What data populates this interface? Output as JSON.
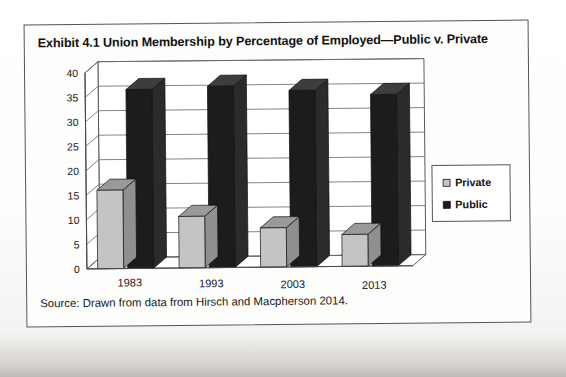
{
  "exhibit": {
    "title": "Exhibit 4.1  Union Membership by Percentage of Employed—Public v. Private",
    "source": "Source: Drawn from data from Hirsch and Macpherson 2014."
  },
  "colors": {
    "private_fill": "#c4c4c4",
    "private_top": "#9a9a9a",
    "private_side": "#8f8f8f",
    "public_fill": "#1c1c1c",
    "public_top": "#3d3d3d",
    "public_side": "#2b2b2b",
    "grid": "#6f6f6f",
    "frame": "#4a4a4a",
    "text": "#1a1a1a"
  },
  "chart_data": {
    "type": "bar",
    "title": "Exhibit 4.1  Union Membership by Percentage of Employed—Public v. Private",
    "subtitle": "",
    "xlabel": "",
    "ylabel": "",
    "categories": [
      "1983",
      "1993",
      "2003",
      "2013"
    ],
    "series": [
      {
        "name": "Private",
        "values": [
          16.0,
          10.5,
          8.0,
          6.5
        ]
      },
      {
        "name": "Public",
        "values": [
          36.5,
          37.0,
          36.0,
          35.0
        ]
      }
    ],
    "ylim": [
      0,
      40
    ],
    "yticks": [
      0,
      5,
      10,
      15,
      20,
      25,
      30,
      35,
      40
    ],
    "ytick_labels": [
      "0",
      "5",
      "10",
      "15",
      "20",
      "25",
      "30",
      "35",
      "40"
    ],
    "grid": true,
    "grid_axis": "y",
    "legend_position": "right",
    "legend_entries": [
      "Private",
      "Public"
    ],
    "style_3d": true
  }
}
